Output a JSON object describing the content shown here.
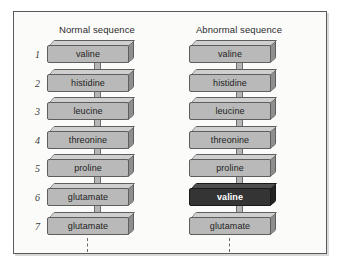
{
  "figure": {
    "columns": [
      {
        "id": "normal",
        "title": "Normal sequence",
        "show_indices": true,
        "residues": [
          {
            "index": "1",
            "label": "valine",
            "highlight": false
          },
          {
            "index": "2",
            "label": "histidine",
            "highlight": false
          },
          {
            "index": "3",
            "label": "leucine",
            "highlight": false
          },
          {
            "index": "4",
            "label": "threonine",
            "highlight": false
          },
          {
            "index": "5",
            "label": "proline",
            "highlight": false
          },
          {
            "index": "6",
            "label": "glutamate",
            "highlight": false
          },
          {
            "index": "7",
            "label": "glutamate",
            "highlight": false
          }
        ]
      },
      {
        "id": "abnormal",
        "title": "Abnormal sequence",
        "show_indices": false,
        "residues": [
          {
            "index": "1",
            "label": "valine",
            "highlight": false
          },
          {
            "index": "2",
            "label": "histidine",
            "highlight": false
          },
          {
            "index": "3",
            "label": "leucine",
            "highlight": false
          },
          {
            "index": "4",
            "label": "threonine",
            "highlight": false
          },
          {
            "index": "5",
            "label": "proline",
            "highlight": false
          },
          {
            "index": "6",
            "label": "valine",
            "highlight": true
          },
          {
            "index": "7",
            "label": "glutamate",
            "highlight": false
          }
        ]
      }
    ],
    "colors": {
      "box_fill": "#b9b9b9",
      "box_top_bevel": "#cfcfcf",
      "box_side_bevel": "#8e8e8e",
      "box_outline": "#5e5e5e",
      "highlight_fill": "#343434",
      "highlight_text": "#ffffff",
      "frame_border": "#5a5a5a",
      "background": "#fbfbfa",
      "text": "#1d1d1d"
    }
  }
}
